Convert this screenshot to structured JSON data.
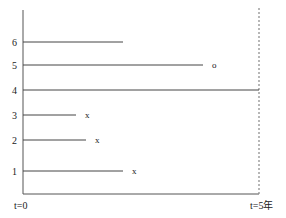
{
  "diagram": {
    "type": "survival-timeline",
    "x_start_label": "t=0",
    "x_end_label": "t=5年",
    "subjects": [
      {
        "id": "1",
        "label": "1",
        "end_x": 123,
        "y": 171,
        "marker": "x"
      },
      {
        "id": "2",
        "label": "2",
        "end_x": 86,
        "y": 140,
        "marker": "x"
      },
      {
        "id": "3",
        "label": "3",
        "end_x": 76,
        "y": 115,
        "marker": "x"
      },
      {
        "id": "4",
        "label": "4",
        "end_x": 259,
        "y": 90,
        "marker": ""
      },
      {
        "id": "5",
        "label": "5",
        "end_x": 203,
        "y": 65,
        "marker": "o"
      },
      {
        "id": "6",
        "label": "6",
        "end_x": 123,
        "y": 42,
        "marker": ""
      }
    ],
    "colors": {
      "line": "#444444",
      "text": "#222222",
      "dotted": "#888888"
    }
  }
}
